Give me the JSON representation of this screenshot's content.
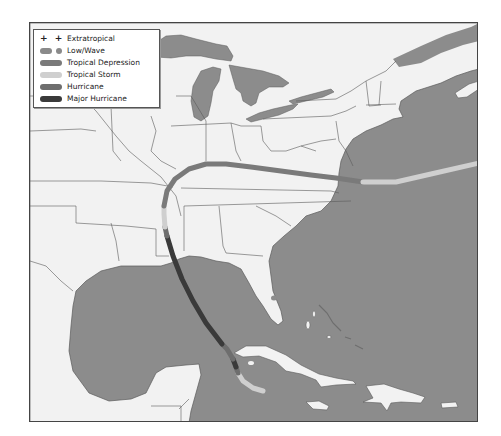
{
  "map": {
    "colors": {
      "water": "#8c8c8c",
      "land": "#f2f2f2",
      "border": "#5a5a5a",
      "frame": "#444444"
    },
    "legend": {
      "items": [
        {
          "key": "extratropical",
          "label": "Extratropical",
          "symbol": "+ +",
          "color": "#222222"
        },
        {
          "key": "low_wave",
          "label": "Low/Wave",
          "color": "#8a8a8a"
        },
        {
          "key": "tropical_depression",
          "label": "Tropical Depression",
          "color": "#7a7a7a"
        },
        {
          "key": "tropical_storm",
          "label": "Tropical Storm",
          "color": "#cfcfcf"
        },
        {
          "key": "hurricane",
          "label": "Hurricane",
          "color": "#6e6e6e"
        },
        {
          "key": "major_hurricane",
          "label": "Major Hurricane",
          "color": "#3a3a3a"
        }
      ]
    },
    "track": {
      "segments": [
        {
          "category": "tropical_storm",
          "color": "#cfcfcf",
          "points": "262,390 252,387 242,380 237,372"
        },
        {
          "category": "hurricane",
          "color": "#6e6e6e",
          "points": "237,372 235,366"
        },
        {
          "category": "major_hurricane",
          "color": "#3a3a3a",
          "points": "235,366 232,358"
        },
        {
          "category": "hurricane",
          "color": "#6e6e6e",
          "points": "232,358 226,348 221,343"
        },
        {
          "category": "major_hurricane",
          "color": "#3a3a3a",
          "points": "221,343 205,322 192,300 181,278 172,255 166,235"
        },
        {
          "category": "hurricane",
          "color": "#6e6e6e",
          "points": "166,235 164,226"
        },
        {
          "category": "tropical_storm",
          "color": "#cfcfcf",
          "points": "164,226 163,213 163,205"
        },
        {
          "category": "tropical_depression",
          "color": "#7a7a7a",
          "points": "163,205 166,190 174,178 188,168 205,163 225,163 250,166 280,170 310,174 335,177 362,181"
        },
        {
          "category": "tropical_storm",
          "color": "#cfcfcf",
          "points": "362,181 395,181 430,173 478,162"
        }
      ]
    }
  }
}
